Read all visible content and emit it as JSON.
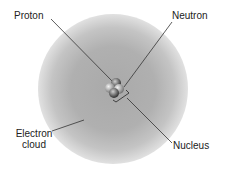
{
  "diagram": {
    "labels": {
      "proton": "Proton",
      "neutron": "Neutron",
      "electron_cloud_line1": "Electron",
      "electron_cloud_line2": "cloud",
      "nucleus": "Nucleus"
    },
    "colors": {
      "cloud": "#b0b0b0",
      "leader_line": "#333333",
      "text": "#222222"
    }
  }
}
